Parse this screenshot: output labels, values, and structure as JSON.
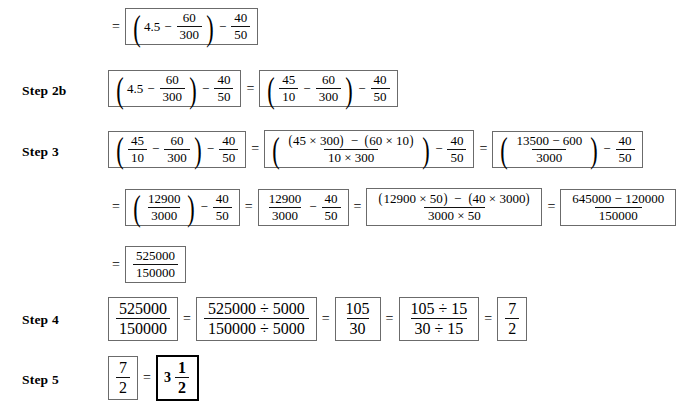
{
  "document": {
    "type": "math-worksheet-solution",
    "title": "Step-by-step fraction simplification",
    "paper_color": "#ffffff",
    "ink_color": "#000000",
    "box_border_color": "#6b6b6b",
    "answer_border_color": "#000000"
  },
  "symbols": {
    "equals": "=",
    "minus": "−",
    "times": "×",
    "divide": "÷",
    "lparen": "(",
    "rparen": ")"
  },
  "rows": {
    "row1": {
      "label": "",
      "lead": "=",
      "expr1": {
        "open": "(",
        "a": "4.5",
        "op1": "−",
        "f1_n": "60",
        "f1_d": "300",
        "close": ")",
        "op2": "−",
        "f2_n": "40",
        "f2_d": "50"
      }
    },
    "row2b": {
      "label": "Step 2b",
      "left": {
        "open": "(",
        "a": "4.5",
        "op1": "−",
        "f1_n": "60",
        "f1_d": "300",
        "close": ")",
        "op2": "−",
        "f2_n": "40",
        "f2_d": "50"
      },
      "eq": "=",
      "right": {
        "open": "(",
        "f0_n": "45",
        "f0_d": "10",
        "op1": "−",
        "f1_n": "60",
        "f1_d": "300",
        "close": ")",
        "op2": "−",
        "f2_n": "40",
        "f2_d": "50"
      }
    },
    "row3": {
      "label": "Step 3",
      "b1": {
        "open": "(",
        "f0_n": "45",
        "f0_d": "10",
        "op1": "−",
        "f1_n": "60",
        "f1_d": "300",
        "close": ")",
        "op2": "−",
        "f2_n": "40",
        "f2_d": "50"
      },
      "eq1": "=",
      "b2": {
        "open": "(",
        "num": "(45 × 300) − (60 × 10)",
        "num_p1_l": "(",
        "num_p1": "45 × 300",
        "num_p1_r": ")",
        "num_mid": "−",
        "num_p2_l": "(",
        "num_p2": "60 × 10",
        "num_p2_r": ")",
        "den": "10 × 300",
        "close": ")",
        "op2": "−",
        "f2_n": "40",
        "f2_d": "50"
      },
      "eq2": "=",
      "b3": {
        "open": "(",
        "num": "13500 − 600",
        "den": "3000",
        "close": ")",
        "op2": "−",
        "f2_n": "40",
        "f2_d": "50"
      }
    },
    "row4": {
      "label": "",
      "lead": "=",
      "b1": {
        "open": "(",
        "num": "12900",
        "den": "3000",
        "close": ")",
        "op2": "−",
        "f2_n": "40",
        "f2_d": "50"
      },
      "eq1": "=",
      "b2": {
        "f1_n": "12900",
        "f1_d": "3000",
        "op": "−",
        "f2_n": "40",
        "f2_d": "50"
      },
      "eq2": "=",
      "b3": {
        "num_p1_l": "(",
        "num_p1": "12900 × 50",
        "num_p1_r": ")",
        "num_mid": "−",
        "num_p2_l": "(",
        "num_p2": "40 × 3000",
        "num_p2_r": ")",
        "den": "3000 × 50"
      },
      "eq3": "=",
      "b4": {
        "num": "645000 − 120000",
        "den": "150000"
      }
    },
    "row5": {
      "label": "",
      "lead": "=",
      "b1": {
        "num": "525000",
        "den": "150000"
      }
    },
    "row6": {
      "label": "Step 4",
      "b1": {
        "num": "525000",
        "den": "150000"
      },
      "eq1": "=",
      "b2": {
        "num": "525000 ÷ 5000",
        "den": "150000 ÷ 5000"
      },
      "eq2": "=",
      "b3": {
        "num": "105",
        "den": "30"
      },
      "eq3": "=",
      "b4": {
        "num": "105 ÷ 15",
        "den": "30 ÷ 15"
      },
      "eq4": "=",
      "b5": {
        "num": "7",
        "den": "2"
      }
    },
    "row7": {
      "label": "Step 5",
      "b1": {
        "num": "7",
        "den": "2"
      },
      "eq1": "=",
      "answer": {
        "whole": "3",
        "num": "1",
        "den": "2"
      }
    }
  }
}
